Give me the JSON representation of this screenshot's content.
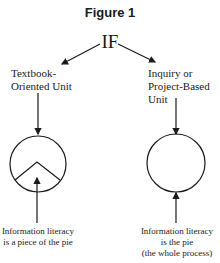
{
  "figure": {
    "title": "Figure 1",
    "root": "IF",
    "left_branch": {
      "label_line1": "Textbook-",
      "label_line2": "Oriented Unit",
      "caption_line1": "Information literacy",
      "caption_line2": "is a piece of the pie"
    },
    "right_branch": {
      "label_line1": "Inquiry or",
      "label_line2": "Project-Based",
      "label_line3": "Unit",
      "caption_line1": "Information literacy",
      "caption_line2": "is the pie",
      "caption_line3": "(the whole process)"
    }
  }
}
